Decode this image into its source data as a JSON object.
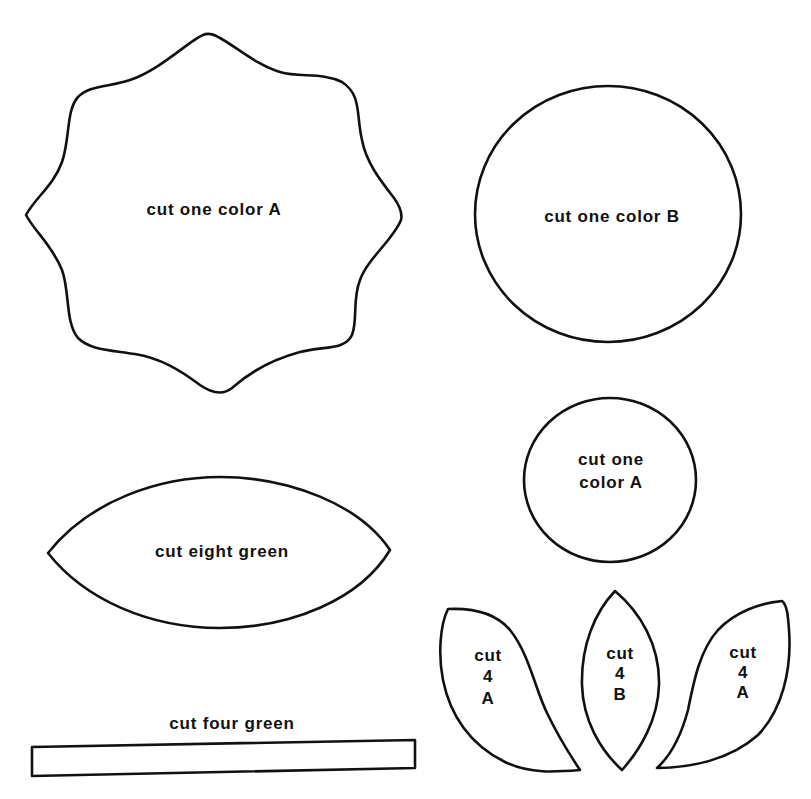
{
  "colors": {
    "background": "#ffffff",
    "outline": "#111111",
    "text": "#111111"
  },
  "pieces": {
    "scalloped_flower": {
      "shape": "eight-point scalloped star",
      "label": "cut one color A"
    },
    "large_circle": {
      "shape": "circle",
      "label": "cut one color B"
    },
    "small_circle": {
      "shape": "circle",
      "label_lines": [
        "cut one",
        "color A"
      ]
    },
    "large_leaf": {
      "shape": "pointed oval leaf",
      "label": "cut eight green"
    },
    "stem": {
      "shape": "long thin rectangle",
      "label": "cut four green"
    },
    "left_petal": {
      "shape": "curved teardrop petal (leaning left)",
      "label_lines": [
        "cut",
        "4",
        "A"
      ]
    },
    "center_petal": {
      "shape": "pointed oval petal",
      "label_lines": [
        "cut",
        "4",
        "B"
      ]
    },
    "right_petal": {
      "shape": "curved teardrop petal (leaning right)",
      "label_lines": [
        "cut",
        "4",
        "A"
      ]
    }
  }
}
